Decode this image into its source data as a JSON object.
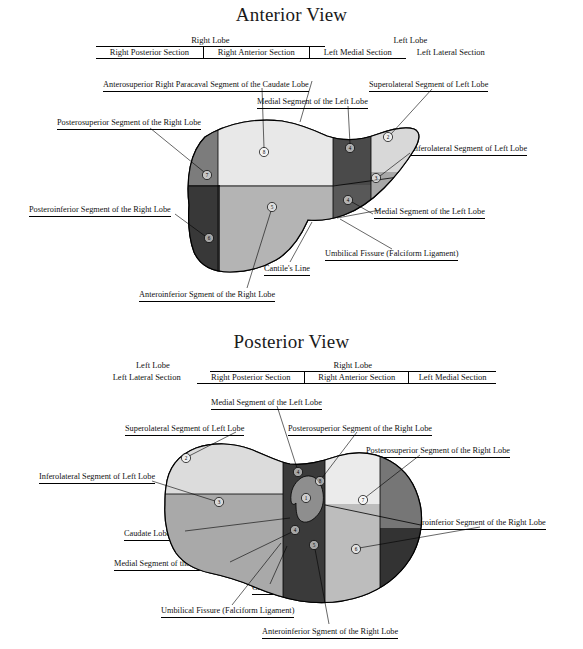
{
  "document": {
    "figure_type": "anatomical-diagram",
    "subject": "Couinaud liver segments",
    "background_color": "#ffffff",
    "ink_color": "#000000"
  },
  "views": [
    {
      "id": "anterior",
      "title": "Anterior View",
      "header": {
        "lobes": [
          {
            "label": "Right Lobe",
            "ruled": true
          },
          {
            "label": "Left Lobe",
            "ruled": false
          }
        ],
        "sections": [
          {
            "label": "Right Posterior Section",
            "ruled": true,
            "divider_left": false
          },
          {
            "label": "Right Anterior Section",
            "ruled": true,
            "divider_left": true
          },
          {
            "label": "Left Medial Section",
            "ruled": true,
            "divider_left": true
          },
          {
            "label": "Left Lateral Section",
            "ruled": false,
            "divider_left": false
          }
        ]
      },
      "labels": [
        {
          "name": "anterosuperior-right-paracaval-caudate",
          "text": "Anterosuperior Right Paracaval Segment of the Caudate Lobe"
        },
        {
          "name": "superolateral-left-lobe",
          "text": "Superolateral Segment of Left Lobe"
        },
        {
          "name": "medial-segment-left-lobe-upper",
          "text": "Medial Segment of the Left Lobe"
        },
        {
          "name": "posterosuperior-right-lobe",
          "text": "Posterosuperior Segment of the Right Lobe"
        },
        {
          "name": "inferolateral-left-lobe",
          "text": "Inferolateral Segment of Left Lobe"
        },
        {
          "name": "posteroinferior-right-lobe",
          "text": "Posteroinferior Segment of the Right Lobe"
        },
        {
          "name": "medial-segment-left-lobe-lower",
          "text": "Medial Segment of the Left Lobe"
        },
        {
          "name": "umbilical-fissure",
          "text": "Umbilical Fissure (Falciform Ligament)"
        },
        {
          "name": "cantlies-line",
          "text": "Cantile's Line"
        },
        {
          "name": "anteroinferior-right-lobe",
          "text": "Anteroinferior Sgment of the Right Lobe"
        }
      ],
      "segments": [
        {
          "number": "8",
          "name": "anterosuperior-right-paracaval-caudate",
          "fill": "#e8e8e8"
        },
        {
          "number": "4",
          "name": "medial-segment-left-lobe-superior",
          "fill": "#4a4a4a"
        },
        {
          "number": "2",
          "name": "superolateral-left-lobe",
          "fill": "#d8d8d8"
        },
        {
          "number": "7",
          "name": "posterosuperior-right-lobe",
          "fill": "#7c7c7c"
        },
        {
          "number": "3",
          "name": "inferolateral-left-lobe",
          "fill": "#a8a8a8"
        },
        {
          "number": "4",
          "name": "medial-segment-left-lobe-inferior",
          "fill": "#585858"
        },
        {
          "number": "5",
          "name": "anteroinferior-right-lobe",
          "fill": "#b4b4b4"
        },
        {
          "number": "6",
          "name": "posteroinferior-right-lobe",
          "fill": "#383838"
        }
      ]
    },
    {
      "id": "posterior",
      "title": "Posterior View",
      "header": {
        "lobes": [
          {
            "label": "Left Lobe",
            "ruled": false
          },
          {
            "label": "Right Lobe",
            "ruled": true
          }
        ],
        "sections": [
          {
            "label": "Left Lateral Section",
            "ruled": false,
            "divider_left": false
          },
          {
            "label": "Right Posterior Section",
            "ruled": true,
            "divider_left": false
          },
          {
            "label": "Right Anterior Section",
            "ruled": true,
            "divider_left": true
          },
          {
            "label": "Left Medial Section",
            "ruled": true,
            "divider_left": true
          }
        ]
      },
      "labels": [
        {
          "name": "medial-segment-left-lobe-upper",
          "text": "Medial Segment of the Left Lobe"
        },
        {
          "name": "superolateral-left-lobe",
          "text": "Superolateral Segment of Left Lobe"
        },
        {
          "name": "posterosuperior-right-lobe-upper",
          "text": "Posterosuperior Segment of the Right Lobe"
        },
        {
          "name": "posterosuperior-right-lobe-lower",
          "text": "Posterosuperior Segment of the Right Lobe"
        },
        {
          "name": "inferolateral-left-lobe",
          "text": "Inferolateral Segment of Left Lobe"
        },
        {
          "name": "caudate-lobe",
          "text": "Caudate Lobe"
        },
        {
          "name": "posteroinferior-right-lobe",
          "text": "Posteroinferior Segment of the Right Lobe"
        },
        {
          "name": "medial-segment-left-lobe-lower",
          "text": "Medial Segment of the Left Lobe"
        },
        {
          "name": "cantlies-line",
          "text": "Cantile's Line"
        },
        {
          "name": "umbilical-fissure",
          "text": "Umbilical Fissure (Falciform Ligament)"
        },
        {
          "name": "anteroinferior-right-lobe",
          "text": "Anteroinferior Sgment of the Right Lobe"
        }
      ],
      "segments": [
        {
          "number": "2",
          "name": "superolateral-left-lobe",
          "fill": "#dcdcdc"
        },
        {
          "number": "4",
          "name": "medial-segment-left-lobe-superior",
          "fill": "#3a3a3a"
        },
        {
          "number": "1",
          "name": "caudate-lobe",
          "fill": "#8e8e8e"
        },
        {
          "number": "8",
          "name": "posterosuperior-right-lobe-upper",
          "fill": "#ebebeb"
        },
        {
          "number": "7",
          "name": "posterosuperior-right-lobe-lower",
          "fill": "#767676"
        },
        {
          "number": "3",
          "name": "inferolateral-left-lobe",
          "fill": "#a9a9a9"
        },
        {
          "number": "4",
          "name": "medial-segment-left-lobe-inferior",
          "fill": "#3a3a3a"
        },
        {
          "number": "5",
          "name": "anteroinferior-right-lobe",
          "fill": "#bdbdbd"
        },
        {
          "number": "6",
          "name": "posteroinferior-right-lobe",
          "fill": "#333333"
        }
      ]
    }
  ]
}
